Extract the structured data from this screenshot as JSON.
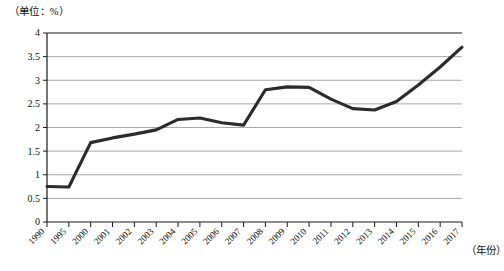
{
  "chart_data": {
    "type": "line",
    "title": "",
    "subtitle": "",
    "unit_label": "（单位：%）",
    "xlabel": "（年份）",
    "ylabel": "",
    "grid": true,
    "legend": null,
    "ylim": [
      0,
      4
    ],
    "ytick_labels": [
      "4",
      "3.5",
      "3",
      "2.5",
      "2",
      "1.5",
      "1",
      "0.5",
      "0"
    ],
    "ytick_values": [
      4,
      3.5,
      3,
      2.5,
      2,
      1.5,
      1,
      0.5,
      0
    ],
    "categories": [
      "1990",
      "1995",
      "2000",
      "2001",
      "2002",
      "2003",
      "2004",
      "2005",
      "2006",
      "2007",
      "2008",
      "2009",
      "2010",
      "2011",
      "2012",
      "2013",
      "2014",
      "2015",
      "2016",
      "2017"
    ],
    "values": [
      0.75,
      0.74,
      1.68,
      1.78,
      1.86,
      1.95,
      2.17,
      2.2,
      2.1,
      2.05,
      2.8,
      2.86,
      2.85,
      2.6,
      2.4,
      2.37,
      2.55,
      2.9,
      3.28,
      3.7
    ],
    "series": [
      {
        "name": "",
        "color": "#2b2b2b",
        "values": [
          0.75,
          0.74,
          1.68,
          1.78,
          1.86,
          1.95,
          2.17,
          2.2,
          2.1,
          2.05,
          2.8,
          2.86,
          2.85,
          2.6,
          2.4,
          2.37,
          2.55,
          2.9,
          3.28,
          3.7
        ]
      }
    ]
  },
  "colors": {
    "line": "#2b2b2b",
    "grid": "#a8a8a8",
    "axis": "#1a1a1a",
    "background": "#ffffff"
  }
}
